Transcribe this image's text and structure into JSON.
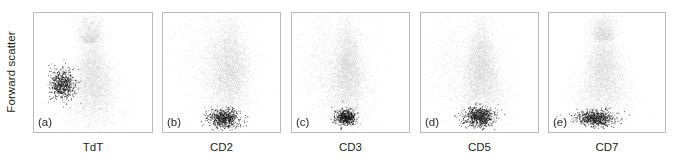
{
  "figure": {
    "axis_label_y": "Forward scatter",
    "width": 680,
    "height": 164,
    "background": "#ffffff",
    "frame_color": "#b9b9ba"
  },
  "panels": [
    {
      "letter": "(a)",
      "xlabel": "TdT",
      "left": 33,
      "width": 120,
      "dark_cluster_position": "left-middle"
    },
    {
      "letter": "(b)",
      "xlabel": "CD2",
      "left": 162,
      "width": 119,
      "dark_cluster_position": "bottom-center"
    },
    {
      "letter": "(c)",
      "xlabel": "CD3",
      "left": 291,
      "width": 119,
      "dark_cluster_position": "bottom-center"
    },
    {
      "letter": "(d)",
      "xlabel": "CD5",
      "left": 420,
      "width": 119,
      "dark_cluster_position": "bottom-center"
    },
    {
      "letter": "(e)",
      "xlabel": "CD7",
      "left": 548,
      "width": 118,
      "dark_cluster_position": "bottom-left-center"
    }
  ],
  "chart_data": {
    "type": "scatter",
    "title": "",
    "xlabel": "",
    "ylabel": "Forward scatter",
    "grid": false,
    "legend": "none",
    "axis_ticks": "none",
    "xlim": [
      0,
      1
    ],
    "ylim": [
      0,
      1
    ],
    "colors": {
      "major_population": "#cfcfcf",
      "highlight_population": "#1a1a1a",
      "sparse_population": "#b0b0b0"
    },
    "panels": [
      {
        "letter": "(a)",
        "x_marker": "TdT",
        "y_marker": "Forward scatter",
        "series": [
          {
            "name": "bulk population",
            "color": "#cfcfcf",
            "n": 4200,
            "shape": "teardrop",
            "center_x": 0.5,
            "center_y": 0.42,
            "spread_x": 0.115,
            "spread_y": 0.2
          },
          {
            "name": "upper tail",
            "color": "#c4c4c4",
            "n": 900,
            "shape": "plume",
            "center_x": 0.47,
            "center_y": 0.8,
            "spread_x": 0.075,
            "spread_y": 0.14
          },
          {
            "name": "blast population (highlighted)",
            "color": "#1a1a1a",
            "n": 600,
            "shape": "blob",
            "center_x": 0.24,
            "center_y": 0.4,
            "spread_x": 0.055,
            "spread_y": 0.065
          }
        ]
      },
      {
        "letter": "(b)",
        "x_marker": "CD2",
        "y_marker": "Forward scatter",
        "series": [
          {
            "name": "bulk population",
            "color": "#cfcfcf",
            "n": 4000,
            "shape": "column",
            "center_x": 0.57,
            "center_y": 0.5,
            "spread_x": 0.095,
            "spread_y": 0.215
          },
          {
            "name": "scattered cells",
            "color": "#9e9e9e",
            "n": 1100,
            "shape": "sparse",
            "center_x": 0.46,
            "center_y": 0.62,
            "spread_x": 0.16,
            "spread_y": 0.23
          },
          {
            "name": "blast population (highlighted)",
            "color": "#1a1a1a",
            "n": 620,
            "shape": "blob",
            "center_x": 0.52,
            "center_y": 0.115,
            "spread_x": 0.065,
            "spread_y": 0.04
          }
        ]
      },
      {
        "letter": "(c)",
        "x_marker": "CD3",
        "y_marker": "Forward scatter",
        "series": [
          {
            "name": "bulk population",
            "color": "#cfcfcf",
            "n": 4000,
            "shape": "teardrop",
            "center_x": 0.48,
            "center_y": 0.47,
            "spread_x": 0.095,
            "spread_y": 0.21
          },
          {
            "name": "scattered cells",
            "color": "#9e9e9e",
            "n": 1300,
            "shape": "sparse",
            "center_x": 0.36,
            "center_y": 0.6,
            "spread_x": 0.16,
            "spread_y": 0.23
          },
          {
            "name": "blast population (highlighted)",
            "color": "#151515",
            "n": 520,
            "shape": "blob",
            "center_x": 0.46,
            "center_y": 0.125,
            "spread_x": 0.043,
            "spread_y": 0.033
          }
        ]
      },
      {
        "letter": "(d)",
        "x_marker": "CD5",
        "y_marker": "Forward scatter",
        "series": [
          {
            "name": "bulk population",
            "color": "#cfcfcf",
            "n": 4100,
            "shape": "teardrop",
            "center_x": 0.52,
            "center_y": 0.48,
            "spread_x": 0.105,
            "spread_y": 0.205
          },
          {
            "name": "scattered cells",
            "color": "#9e9e9e",
            "n": 1200,
            "shape": "sparse",
            "center_x": 0.4,
            "center_y": 0.58,
            "spread_x": 0.17,
            "spread_y": 0.23
          },
          {
            "name": "blast population (highlighted)",
            "color": "#1a1a1a",
            "n": 680,
            "shape": "blob",
            "center_x": 0.5,
            "center_y": 0.125,
            "spread_x": 0.07,
            "spread_y": 0.042
          }
        ]
      },
      {
        "letter": "(e)",
        "x_marker": "CD7",
        "y_marker": "Forward scatter",
        "series": [
          {
            "name": "bulk population",
            "color": "#cfcfcf",
            "n": 4400,
            "shape": "teardrop",
            "center_x": 0.47,
            "center_y": 0.47,
            "spread_x": 0.125,
            "spread_y": 0.2
          },
          {
            "name": "upper tail",
            "color": "#c4c4c4",
            "n": 950,
            "shape": "plume",
            "center_x": 0.47,
            "center_y": 0.82,
            "spread_x": 0.085,
            "spread_y": 0.13
          },
          {
            "name": "blast population (highlighted)",
            "color": "#1a1a1a",
            "n": 640,
            "shape": "blob",
            "center_x": 0.4,
            "center_y": 0.115,
            "spread_x": 0.085,
            "spread_y": 0.032
          }
        ]
      }
    ]
  }
}
